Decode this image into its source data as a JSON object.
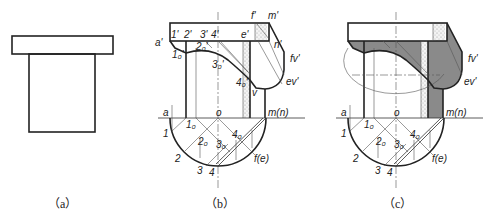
{
  "figure": {
    "panels": [
      {
        "id": "a",
        "caption": "（a）"
      },
      {
        "id": "b",
        "caption": "（b）"
      },
      {
        "id": "c",
        "caption": "（c）"
      }
    ],
    "labels_b": {
      "a_prime": "a'",
      "p1": "1'",
      "p2": "2'",
      "p3": "3'",
      "p4": "4'",
      "e_prime": "e'",
      "f_prime": "f'",
      "m_prime": "m'",
      "n_prime": "n'",
      "fv": "fv'",
      "ev": "ev'",
      "p10": "1₀'",
      "p20": "2₀'",
      "p30": "3₀'",
      "p40": "4₀'",
      "v": "v",
      "a": "a",
      "o": "o",
      "mn": "m(n)",
      "q1": "1",
      "q2": "2",
      "q3": "3",
      "q4": "4",
      "fe": "f(e)",
      "q10": "1₀",
      "q20": "2₀",
      "q30": "3₀",
      "q40": "4₀"
    },
    "labels_c": {
      "fv": "fv'",
      "ev": "ev'",
      "a": "a",
      "o": "o",
      "mn": "m(n)",
      "q1": "1",
      "q2": "2",
      "q3": "3",
      "q4": "4",
      "fe": "f(e)",
      "q10": "1₀",
      "q20": "2₀",
      "q30": "3₀",
      "q40": "4₀"
    },
    "colors": {
      "line": "#222222",
      "shadow": "#8a8a8a",
      "stipple": "#d9d9d9"
    }
  }
}
